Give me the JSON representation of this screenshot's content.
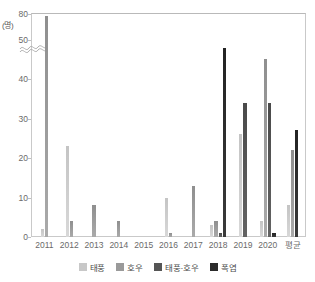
{
  "chart_data": {
    "type": "bar",
    "title": "",
    "subtitle": "",
    "xlabel": "",
    "ylabel": "",
    "unit_label": "(명)",
    "categories": [
      "2011",
      "2012",
      "2013",
      "2014",
      "2015",
      "2016",
      "2017",
      "2018",
      "2019",
      "2020",
      "평균"
    ],
    "series": [
      {
        "name": "태풍",
        "color": "#c8c8c8",
        "values": [
          2,
          23,
          0,
          0,
          0,
          10,
          0,
          3,
          26,
          4,
          8
        ]
      },
      {
        "name": "호우",
        "color": "#9a9a9a",
        "values": [
          78,
          4,
          8,
          4,
          0,
          1,
          13,
          4,
          0,
          45,
          22
        ]
      },
      {
        "name": "태풍·호우",
        "color": "#555555",
        "values": [
          0,
          0,
          0,
          0,
          0,
          0,
          0,
          1,
          34,
          34,
          0
        ]
      },
      {
        "name": "폭염",
        "color": "#2b2b2b",
        "values": [
          0,
          0,
          0,
          0,
          0,
          0,
          0,
          48,
          0,
          1,
          27
        ]
      }
    ],
    "y_ticks": [
      "0",
      "10",
      "20",
      "30",
      "40",
      "50",
      "80"
    ],
    "ylim": [
      0,
      80
    ],
    "y_axis_break": {
      "from": 50,
      "to": 80,
      "style": "wavy"
    },
    "grid": false,
    "legend_position": "bottom"
  },
  "legend": {
    "items": [
      {
        "label": "태풍"
      },
      {
        "label": "호우"
      },
      {
        "label": "태풍·호우"
      },
      {
        "label": "폭염"
      }
    ]
  }
}
